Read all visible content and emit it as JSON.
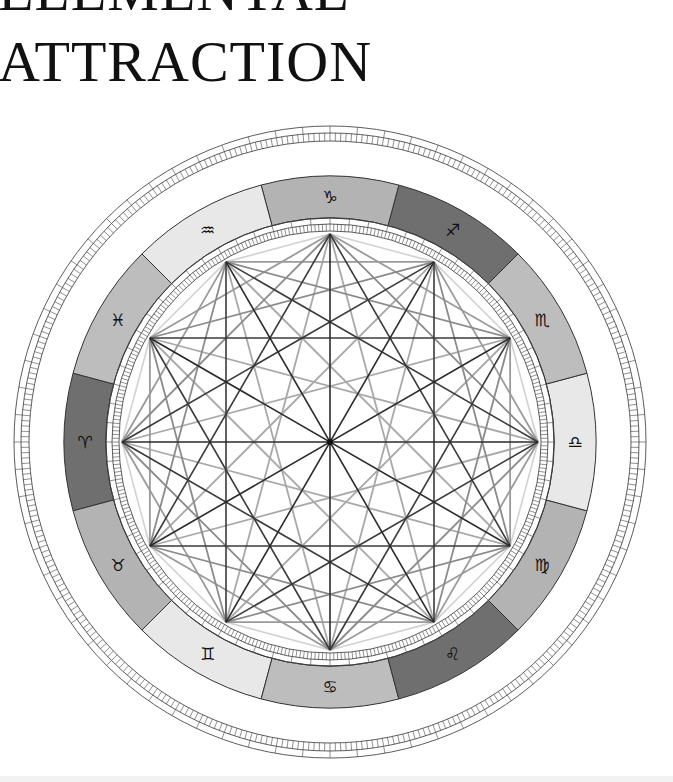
{
  "title": {
    "line1": "ELEMENTAL",
    "line2": "ATTRACTION"
  },
  "wheel": {
    "center": [
      330,
      442
    ],
    "outer_ring": {
      "r_outer": 316,
      "r_mid": 309,
      "r_inner": 301,
      "major_tick_deg": 5,
      "minor_tick_deg": 1
    },
    "zodiac_band": {
      "r_outer": 266,
      "r_inner": 224,
      "stroke": "#333333"
    },
    "inner_ruler": {
      "r_outer": 224,
      "r_mid": 218,
      "r_inner": 211,
      "major_tick_deg": 5,
      "minor_tick_deg": 1
    },
    "vertex_radius": 208,
    "element_colors": {
      "fire": "#6f6f6f",
      "earth": "#b3b3b3",
      "air": "#e8e8e8",
      "water": "#bdbdbd"
    },
    "signs": [
      {
        "name": "Aries",
        "glyph": "♈",
        "element": "fire",
        "angle": 180
      },
      {
        "name": "Taurus",
        "glyph": "♉",
        "element": "earth",
        "angle": 150
      },
      {
        "name": "Gemini",
        "glyph": "♊",
        "element": "air",
        "angle": 120
      },
      {
        "name": "Cancer",
        "glyph": "♋",
        "element": "water",
        "angle": 90
      },
      {
        "name": "Leo",
        "glyph": "♌",
        "element": "fire",
        "angle": 60
      },
      {
        "name": "Virgo",
        "glyph": "♍",
        "element": "earth",
        "angle": 30
      },
      {
        "name": "Libra",
        "glyph": "♎",
        "element": "air",
        "angle": 0
      },
      {
        "name": "Scorpio",
        "glyph": "♏",
        "element": "water",
        "angle": -30
      },
      {
        "name": "Sagittarius",
        "glyph": "♐",
        "element": "fire",
        "angle": -60
      },
      {
        "name": "Capricorn",
        "glyph": "♑",
        "element": "earth",
        "angle": -90
      },
      {
        "name": "Aquarius",
        "glyph": "♒",
        "element": "air",
        "angle": -120
      },
      {
        "name": "Pisces",
        "glyph": "♓",
        "element": "water",
        "angle": -150
      }
    ],
    "aspect_styles": {
      "30": {
        "color": "#d2d2d2",
        "width": 1.6
      },
      "60": {
        "color": "#9a9a9a",
        "width": 1.8
      },
      "90": {
        "color": "#8a8a8a",
        "width": 1.8
      },
      "120": {
        "color": "#3a3a3a",
        "width": 1.6
      },
      "150": {
        "color": "#a8a8a8",
        "width": 1.8
      },
      "180": {
        "color": "#2a2a2a",
        "width": 1.6
      }
    }
  }
}
